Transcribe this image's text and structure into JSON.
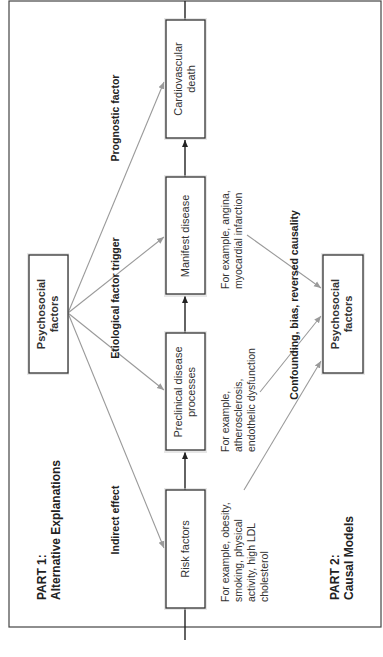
{
  "figure": {
    "orientation": "rotated-90-ccw",
    "part1": {
      "line1": "PART 1:",
      "line2": "Alternative Explanations"
    },
    "part2": {
      "line1": "PART 2:",
      "line2": "Causal Models"
    },
    "nodes": {
      "psychosocial_top": {
        "line1": "Psychosocial",
        "line2": "factors"
      },
      "risk_factors": {
        "line1": "Risk factors"
      },
      "preclinical": {
        "line1": "Preclinical disease",
        "line2": "processes"
      },
      "manifest": {
        "line1": "Manifest disease"
      },
      "cv_death": {
        "line1": "Cardiovascular",
        "line2": "death"
      },
      "psychosocial_bottom": {
        "line1": "Psychosocial",
        "line2": "factors"
      }
    },
    "edge_labels": {
      "indirect": "Indirect effect",
      "etiological": "Etiological factor trigger",
      "prognostic": "Prognostic factor",
      "confounding": "Confounding, bias, reversed causality"
    },
    "notes": {
      "risk": [
        "For example, obesity,",
        "smoking, physical",
        "activity, high LDL",
        "cholesterol"
      ],
      "preclinical": [
        "For example,",
        "atherosclerosis,",
        "endothelic dysfunction"
      ],
      "manifest": [
        "For example, angina,",
        "myocardial infarction"
      ]
    },
    "colors": {
      "frame": "#444444",
      "box_border": "#333333",
      "grey_arrow": "#9a9a9a",
      "dark_arrow": "#222222"
    }
  }
}
